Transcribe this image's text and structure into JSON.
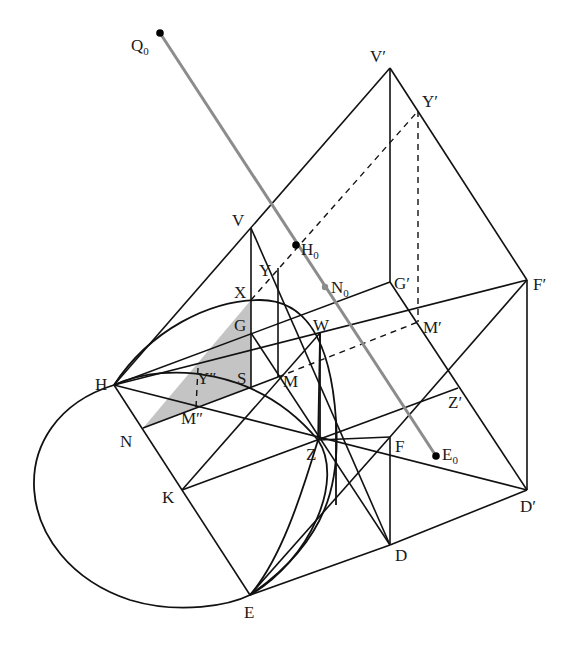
{
  "figure": {
    "width": 580,
    "height": 651,
    "colors": {
      "stroke": "#111111",
      "gray_line": "#8c8c8c",
      "shade": "#c4c4c4",
      "background": "#ffffff"
    }
  },
  "points": {
    "Q0": [
      160,
      33
    ],
    "V1": [
      390,
      68
    ],
    "Y1": [
      418,
      111
    ],
    "V": [
      251,
      228
    ],
    "H0": [
      296,
      245
    ],
    "Y": [
      278,
      268
    ],
    "N0": [
      325,
      287
    ],
    "G1": [
      390,
      282
    ],
    "F1": [
      527,
      280
    ],
    "X": [
      251,
      300
    ],
    "G": [
      251,
      333
    ],
    "W": [
      320,
      333
    ],
    "M1": [
      418,
      322
    ],
    "Y2": [
      198,
      368
    ],
    "S": [
      251,
      387
    ],
    "M": [
      278,
      377
    ],
    "H": [
      114,
      385
    ],
    "M2": [
      196,
      407
    ],
    "N": [
      143,
      428
    ],
    "Z1": [
      458,
      388
    ],
    "Z": [
      318,
      440
    ],
    "F": [
      390,
      437
    ],
    "E0": [
      436,
      456
    ],
    "K": [
      182,
      490
    ],
    "D1": [
      527,
      490
    ],
    "D": [
      390,
      545
    ],
    "E": [
      250,
      595
    ]
  },
  "labels": [
    {
      "id": "Q0",
      "text": "Q",
      "sub": "0",
      "x": 131,
      "y": 51
    },
    {
      "id": "V1",
      "text": "V′",
      "sub": "",
      "x": 370,
      "y": 62
    },
    {
      "id": "Y1",
      "text": "Y′",
      "sub": "",
      "x": 422,
      "y": 107
    },
    {
      "id": "V",
      "text": "V",
      "sub": "",
      "x": 232,
      "y": 226
    },
    {
      "id": "H0",
      "text": "H",
      "sub": "0",
      "x": 301,
      "y": 255
    },
    {
      "id": "Y",
      "text": "Y",
      "sub": "",
      "x": 259,
      "y": 276
    },
    {
      "id": "N0",
      "text": "N",
      "sub": "0",
      "x": 331,
      "y": 293
    },
    {
      "id": "G1",
      "text": "G′",
      "sub": "",
      "x": 394,
      "y": 289
    },
    {
      "id": "F1",
      "text": "F′",
      "sub": "",
      "x": 533,
      "y": 290
    },
    {
      "id": "X",
      "text": "X",
      "sub": "",
      "x": 234,
      "y": 298
    },
    {
      "id": "G",
      "text": "G",
      "sub": "",
      "x": 234,
      "y": 331
    },
    {
      "id": "W",
      "text": "W",
      "sub": "",
      "x": 313,
      "y": 331
    },
    {
      "id": "M1",
      "text": "M′",
      "sub": "",
      "x": 423,
      "y": 333
    },
    {
      "id": "Y2",
      "text": "Y″",
      "sub": "",
      "x": 197,
      "y": 384
    },
    {
      "id": "S",
      "text": "S",
      "sub": "",
      "x": 237,
      "y": 384
    },
    {
      "id": "M",
      "text": "M",
      "sub": "",
      "x": 283,
      "y": 387
    },
    {
      "id": "H",
      "text": "H",
      "sub": "",
      "x": 95,
      "y": 390
    },
    {
      "id": "M2",
      "text": "M″",
      "sub": "",
      "x": 181,
      "y": 424
    },
    {
      "id": "N",
      "text": "N",
      "sub": "",
      "x": 120,
      "y": 447
    },
    {
      "id": "Z1",
      "text": "Z′",
      "sub": "",
      "x": 448,
      "y": 408
    },
    {
      "id": "Z",
      "text": "Z",
      "sub": "",
      "x": 306,
      "y": 460
    },
    {
      "id": "F",
      "text": "F",
      "sub": "",
      "x": 395,
      "y": 452
    },
    {
      "id": "E0",
      "text": "E",
      "sub": "0",
      "x": 442,
      "y": 460
    },
    {
      "id": "K",
      "text": "K",
      "sub": "",
      "x": 162,
      "y": 503
    },
    {
      "id": "D1",
      "text": "D′",
      "sub": "",
      "x": 520,
      "y": 512
    },
    {
      "id": "D",
      "text": "D",
      "sub": "",
      "x": 395,
      "y": 561
    },
    {
      "id": "E",
      "text": "E",
      "sub": "",
      "x": 244,
      "y": 618
    }
  ],
  "segments": [
    [
      "H",
      "V1"
    ],
    [
      "V1",
      "G1"
    ],
    [
      "V1",
      "F1"
    ],
    [
      "F1",
      "D1"
    ],
    [
      "G1",
      "D1"
    ],
    [
      "V",
      "X"
    ],
    [
      "X",
      "S"
    ],
    [
      "V",
      "D"
    ],
    [
      "H",
      "G1"
    ],
    [
      "H",
      "F1"
    ],
    [
      "H",
      "D1"
    ],
    [
      "H",
      "E"
    ],
    [
      "K",
      "Z1"
    ],
    [
      "K",
      "W"
    ],
    [
      "G",
      "D"
    ],
    [
      "E",
      "F"
    ],
    [
      "E",
      "D"
    ],
    [
      "D",
      "D1"
    ],
    [
      "F",
      "D"
    ],
    [
      "F",
      "F1"
    ],
    [
      "Z",
      "F"
    ],
    [
      "N",
      "M"
    ],
    [
      "Y",
      "M"
    ],
    [
      "W",
      "Z"
    ]
  ],
  "dashed_segments": [
    [
      "X",
      "Y1"
    ],
    [
      "Y1",
      "M1"
    ],
    [
      "M",
      "M1"
    ],
    [
      "Y2",
      "M2"
    ]
  ],
  "gray_segments": [
    [
      "Q0",
      "E0"
    ]
  ],
  "dots": [
    "Q0",
    "H0",
    "E0"
  ],
  "gray_dots": [
    "N0"
  ],
  "shaded_polygon": [
    "N",
    "X",
    "S"
  ],
  "curves": [
    {
      "name": "outer-ellipse-arc",
      "d": "M 114 385 C 0 420, 10 560, 130 600 C 180 615, 230 605, 250 595"
    },
    {
      "name": "upper-arc-H-X-W",
      "d": "M 114 385 C 150 330, 210 300, 260 300 C 300 300, 330 330, 336 420 C 340 480, 330 540, 250 595"
    },
    {
      "name": "middle-arc-H-S-Z-E",
      "d": "M 114 385 C 170 360, 260 370, 318 440 C 345 480, 310 560, 250 595"
    },
    {
      "name": "inner-arc-Z-E",
      "d": "M 318 440 C 300 500, 280 560, 250 595"
    },
    {
      "name": "tangent-vertical",
      "d": "M 336 420 L 336 505"
    },
    {
      "name": "vertical-W-Z",
      "d": "M 320 333 L 320 440"
    }
  ]
}
